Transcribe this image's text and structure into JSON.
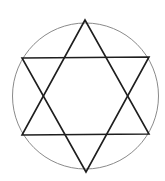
{
  "figure": {
    "width": 165,
    "height": 181,
    "background": "#ffffff"
  },
  "circle": {
    "cx": 85.5,
    "cy": 96,
    "r": 73,
    "stroke": "#8a8a8a",
    "stroke_width": 1
  },
  "triangles": [
    {
      "name": "upward-triangle",
      "points": [
        [
          85,
          20
        ],
        [
          22,
          135
        ],
        [
          149,
          134
        ]
      ],
      "stroke": "#1e1e1e",
      "stroke_width": 1.6
    },
    {
      "name": "downward-triangle",
      "points": [
        [
          22,
          58
        ],
        [
          149,
          57
        ],
        [
          86,
          172
        ]
      ],
      "stroke": "#1e1e1e",
      "stroke_width": 1.6
    }
  ]
}
